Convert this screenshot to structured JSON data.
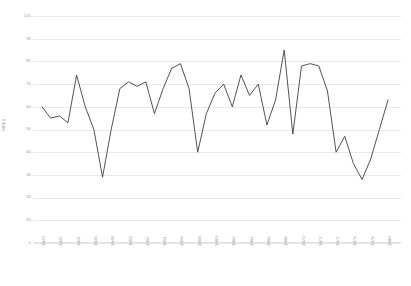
{
  "chart_data": {
    "type": "line",
    "title": "",
    "xlabel": "",
    "ylabel": "INDEX",
    "ylim": [
      0,
      100
    ],
    "ytick_step": 10,
    "yticks": [
      0,
      10,
      20,
      30,
      40,
      50,
      60,
      70,
      80,
      90,
      100
    ],
    "ytick_labels": [
      "0",
      "10",
      "20",
      "30",
      "40",
      "50",
      "60",
      "70",
      "80",
      "90",
      "100"
    ],
    "grid": true,
    "legend": "none",
    "xtick_labels": [
      "1840",
      "1842",
      "1844",
      "1846",
      "1848",
      "1850",
      "1852",
      "1854",
      "1856",
      "1858",
      "1860",
      "1862",
      "1864",
      "1866",
      "1868",
      "1870",
      "1872",
      "1874",
      "1876",
      "1878",
      "1880"
    ],
    "xtick_rotation": -90,
    "x": [
      1840,
      1841,
      1842,
      1843,
      1844,
      1845,
      1846,
      1847,
      1848,
      1849,
      1850,
      1851,
      1852,
      1853,
      1854,
      1855,
      1856,
      1857,
      1858,
      1859,
      1860,
      1861,
      1862,
      1863,
      1864,
      1865,
      1866,
      1867,
      1868,
      1869,
      1870,
      1871,
      1872,
      1873,
      1874,
      1875,
      1876,
      1877,
      1878,
      1879,
      1880
    ],
    "values": [
      60,
      55,
      56,
      53,
      74,
      60,
      50,
      29,
      50,
      68,
      71,
      69,
      71,
      57,
      68,
      77,
      79,
      68,
      40,
      57,
      66,
      70,
      60,
      74,
      65,
      70,
      52,
      63,
      85,
      48,
      78,
      79,
      78,
      67,
      40,
      47,
      35,
      28,
      37,
      50,
      63
    ],
    "series": [
      {
        "name": "INDEX",
        "color": "#404040",
        "values": [
          60,
          55,
          56,
          53,
          74,
          60,
          50,
          29,
          50,
          68,
          71,
          69,
          71,
          57,
          68,
          77,
          79,
          68,
          40,
          57,
          66,
          70,
          60,
          74,
          65,
          70,
          52,
          63,
          85,
          48,
          78,
          79,
          78,
          67,
          40,
          47,
          35,
          28,
          37,
          50,
          63
        ]
      }
    ],
    "xlim": [
      1840,
      1880
    ],
    "line_color": "#404040",
    "grid_color": "#e8e8ea",
    "axis_label_color": "#9a9a9a"
  }
}
